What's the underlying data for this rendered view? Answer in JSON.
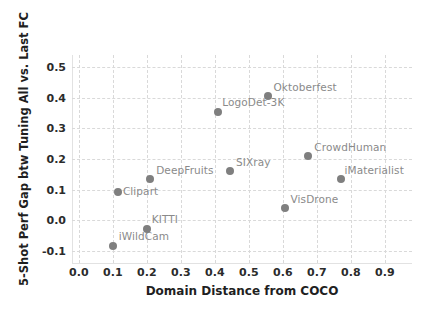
{
  "chart_data": {
    "type": "scatter",
    "title": "",
    "xlabel": "Domain Distance from COCO",
    "ylabel": "5-Shot Perf Gap btw Tuning All vs. Last FC",
    "xlim": [
      -0.02,
      0.98
    ],
    "ylim": [
      -0.14,
      0.54
    ],
    "xticks": [
      "0.0",
      "0.1",
      "0.2",
      "0.3",
      "0.4",
      "0.5",
      "0.6",
      "0.7",
      "0.8",
      "0.9"
    ],
    "xtick_values": [
      0.0,
      0.1,
      0.2,
      0.3,
      0.4,
      0.5,
      0.6,
      0.7,
      0.8,
      0.9
    ],
    "yticks": [
      "-0.1",
      "0.0",
      "0.1",
      "0.2",
      "0.3",
      "0.4",
      "0.5"
    ],
    "ytick_values": [
      -0.1,
      0.0,
      0.1,
      0.2,
      0.3,
      0.4,
      0.5
    ],
    "grid": true,
    "legend": "none",
    "marker_color": "#7f7f7f",
    "label_color": "#8a8a8a",
    "points": [
      {
        "name": "iWildCam",
        "x": 0.1,
        "y": -0.085,
        "label_dx": 6,
        "label_dy": -16
      },
      {
        "name": "KITTI",
        "x": 0.2,
        "y": -0.028,
        "label_dx": 5,
        "label_dy": -16
      },
      {
        "name": "Clipart",
        "x": 0.115,
        "y": 0.092,
        "label_dx": 5,
        "label_dy": -7
      },
      {
        "name": "DeepFruits",
        "x": 0.21,
        "y": 0.134,
        "label_dx": 6,
        "label_dy": -15
      },
      {
        "name": "SIXray",
        "x": 0.445,
        "y": 0.161,
        "label_dx": 6,
        "label_dy": -15
      },
      {
        "name": "LogoDet-3K",
        "x": 0.41,
        "y": 0.355,
        "label_dx": 4,
        "label_dy": -16
      },
      {
        "name": "Oktoberfest",
        "x": 0.555,
        "y": 0.405,
        "label_dx": 6,
        "label_dy": -15
      },
      {
        "name": "CrowdHuman",
        "x": 0.675,
        "y": 0.209,
        "label_dx": 6,
        "label_dy": -15
      },
      {
        "name": "VisDrone",
        "x": 0.605,
        "y": 0.04,
        "label_dx": 6,
        "label_dy": -15
      },
      {
        "name": "iMaterialist",
        "x": 0.77,
        "y": 0.133,
        "label_dx": 4,
        "label_dy": -15
      }
    ]
  }
}
